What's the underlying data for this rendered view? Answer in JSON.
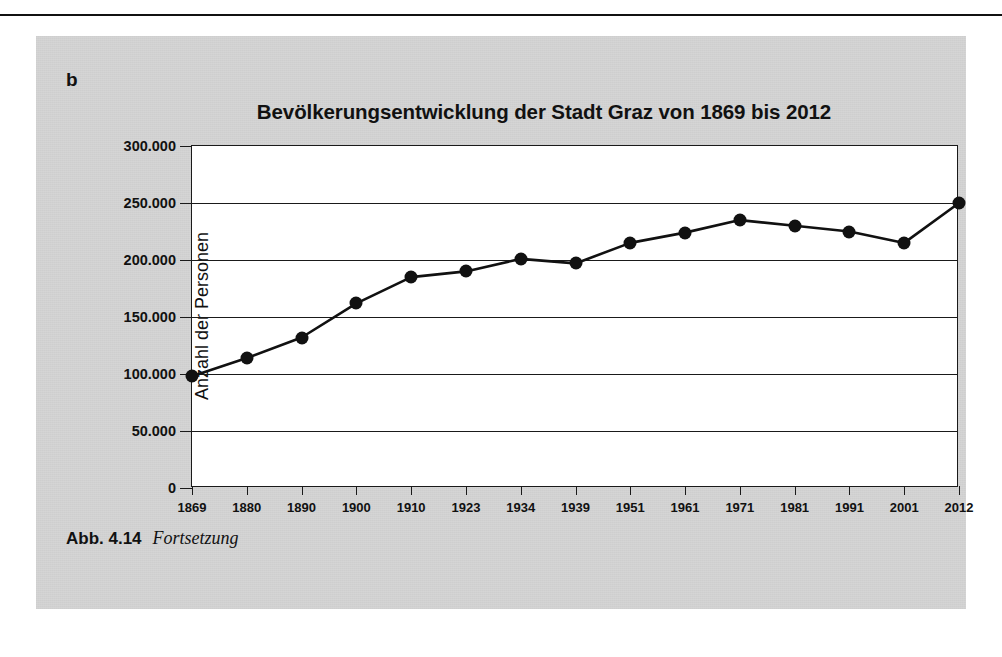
{
  "panel": {
    "letter": "b",
    "caption_label": "Abb. 4.14",
    "caption_text": "Fortsetzung",
    "background_color": "#d4d4d4",
    "page_color": "#ffffff"
  },
  "chart_data": {
    "type": "line",
    "title": "Bevölkerungsentwicklung der Stadt Graz von 1869 bis 2012",
    "xlabel": "",
    "ylabel": "Anzahl der Personen",
    "categories": [
      "1869",
      "1880",
      "1890",
      "1900",
      "1910",
      "1923",
      "1934",
      "1939",
      "1951",
      "1961",
      "1971",
      "1981",
      "1991",
      "2001",
      "2012"
    ],
    "values": [
      98000,
      114000,
      132000,
      162000,
      185000,
      190000,
      201000,
      197000,
      215000,
      224000,
      235000,
      230000,
      225000,
      215000,
      250000
    ],
    "ylim": [
      0,
      300000
    ],
    "ytick_values": [
      0,
      50000,
      100000,
      150000,
      200000,
      250000,
      300000
    ],
    "ytick_labels": [
      "0",
      "50.000",
      "100.000",
      "150.000",
      "200.000",
      "250.000",
      "300.000"
    ],
    "grid": true,
    "legend": "none",
    "marker": "filled-circle",
    "line_color": "#111111",
    "marker_color": "#111111",
    "plot_background": "#ffffff"
  }
}
